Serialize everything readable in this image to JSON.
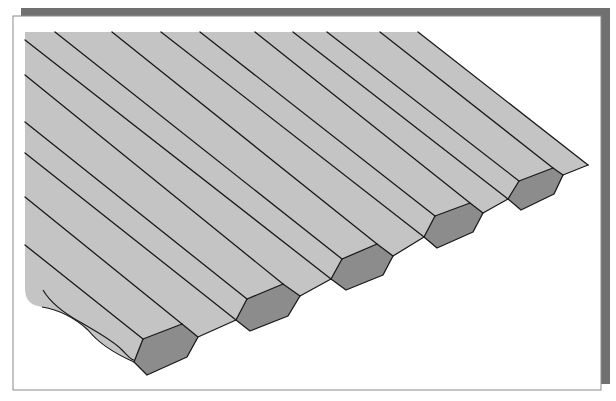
{
  "figure": {
    "colors": {
      "background": "#ffffff",
      "frame_shadow": "#707070",
      "frame_border": "#8a8a8a",
      "surface": "#c4c4c4",
      "hex_face": "#8c8c8c",
      "line": "#1a1a1a"
    },
    "prism_count": 5
  }
}
